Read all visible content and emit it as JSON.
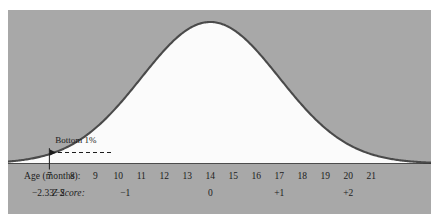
{
  "figure": {
    "panel_color": "#a8a8a8",
    "curve_color": "#4a4a4a",
    "fill_color": "#fbfbfb",
    "text_color": "#1c1c1c"
  },
  "annotation": {
    "label": "Bottom 1%",
    "arrow": "dashed-left-arrow"
  },
  "axes": {
    "age_label": "Age (months):",
    "z_label": "Z Score:",
    "age_ticks": [
      "7",
      "8",
      "9",
      "10",
      "11",
      "12",
      "13",
      "14",
      "15",
      "16",
      "17",
      "18",
      "19",
      "20",
      "21"
    ],
    "z_ticks": [
      {
        "label": "−2.33",
        "age": 6.72
      },
      {
        "label": "−2",
        "age": 7.45
      },
      {
        "label": "−1",
        "age": 10.3
      },
      {
        "label": "0",
        "age": 14.0
      },
      {
        "label": "+1",
        "age": 17.0
      },
      {
        "label": "+2",
        "age": 20.0
      }
    ]
  },
  "chart_data": {
    "type": "area",
    "title": "",
    "xlabel": "Age (months):",
    "ylabel": "",
    "xlim": [
      5.2,
      23.6
    ],
    "ylim": [
      0,
      1
    ],
    "grid": false,
    "legend": "none",
    "distribution": "normal",
    "mean_age_months": 14.0,
    "sd_months": 3.0,
    "cutoff": {
      "age_months": 7,
      "z_score": -2.33,
      "tail_percent": 1,
      "tail_label": "Bottom 1%"
    },
    "x": [
      5.2,
      6.0,
      7.0,
      8.0,
      9.0,
      10.0,
      11.0,
      12.0,
      13.0,
      14.0,
      15.0,
      16.0,
      17.0,
      18.0,
      19.0,
      20.0,
      21.0,
      22.0,
      23.6
    ],
    "y": [
      0.011,
      0.022,
      0.045,
      0.082,
      0.135,
      0.199,
      0.264,
      0.324,
      0.368,
      0.384,
      0.368,
      0.324,
      0.264,
      0.199,
      0.135,
      0.082,
      0.045,
      0.022,
      0.006
    ],
    "y_normalized": [
      0.029,
      0.057,
      0.117,
      0.214,
      0.352,
      0.518,
      0.687,
      0.844,
      0.959,
      1.0,
      0.959,
      0.844,
      0.687,
      0.518,
      0.352,
      0.214,
      0.117,
      0.057,
      0.016
    ]
  }
}
